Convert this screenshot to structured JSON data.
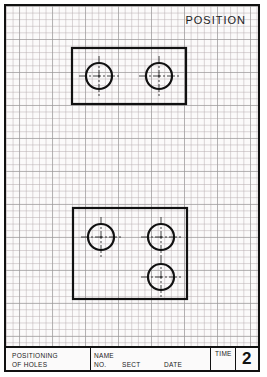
{
  "sheet": {
    "title": "POSITION"
  },
  "title_block": {
    "subject_line1": "POSITIONING",
    "subject_line2": "OF HOLES",
    "name_label": "NAME",
    "no_label": "NO.",
    "sect_label": "SECT",
    "date_label": "DATE",
    "time_label": "TIME",
    "sheet_number": "2"
  },
  "drawings": [
    {
      "name": "top-plate",
      "rect": {
        "x": 72,
        "y": 48,
        "w": 114,
        "h": 56
      },
      "holes": [
        {
          "cx": 99,
          "cy": 76,
          "r": 13
        },
        {
          "cx": 159,
          "cy": 76,
          "r": 13
        }
      ]
    },
    {
      "name": "bottom-plate",
      "rect": {
        "x": 73,
        "y": 208,
        "w": 114,
        "h": 91
      },
      "holes": [
        {
          "cx": 101,
          "cy": 237,
          "r": 13
        },
        {
          "cx": 161,
          "cy": 237,
          "r": 13
        },
        {
          "cx": 161,
          "cy": 277,
          "r": 13
        }
      ]
    }
  ]
}
